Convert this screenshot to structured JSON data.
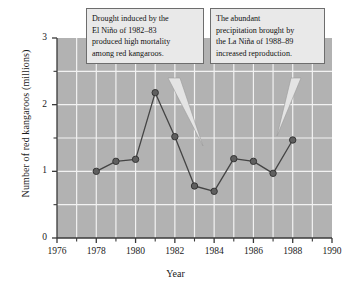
{
  "chart_data": {
    "type": "line",
    "title": "",
    "xlabel": "Year",
    "ylabel": "Number of red kangaroos (millions)",
    "xlim": [
      1976,
      1990
    ],
    "ylim": [
      0,
      3
    ],
    "x_major_ticks": [
      1976,
      1978,
      1980,
      1982,
      1984,
      1986,
      1988,
      1990
    ],
    "x_minor_ticks": [
      1977,
      1979,
      1981,
      1983,
      1985,
      1987,
      1989
    ],
    "y_major_ticks": [
      0,
      1,
      2,
      3
    ],
    "y_minor_ticks": [
      0.5,
      1.5,
      2.5
    ],
    "x_tick_labels": [
      "1976",
      "1978",
      "1980",
      "1982",
      "1984",
      "1986",
      "1988",
      "1990"
    ],
    "y_tick_labels": [
      "0",
      "1",
      "2",
      "3"
    ],
    "grid": true,
    "legend": null,
    "series": [
      {
        "name": "Red kangaroo population",
        "x": [
          1978,
          1979,
          1980,
          1981,
          1982,
          1983,
          1984,
          1985,
          1986,
          1987,
          1988
        ],
        "values": [
          1.0,
          1.15,
          1.18,
          2.18,
          1.52,
          0.78,
          0.7,
          1.19,
          1.15,
          0.97,
          1.47
        ]
      }
    ],
    "annotations": [
      {
        "id": "drought",
        "lines": [
          "Drought induced by the",
          "El Niño of 1982–83",
          "produced high mortality",
          "among red kangaroos."
        ],
        "points_to_year": 1983
      },
      {
        "id": "rain",
        "lines": [
          "The abundant",
          "precipitation brought by",
          "the La Niña of 1988–89",
          "increased reproduction."
        ],
        "points_to_year": 1988
      }
    ],
    "colors": {
      "plot_background": "#b2b2b2",
      "gridline": "#f2f2f2",
      "marker_fill": "#5f5f5f",
      "marker_stroke": "#353535",
      "line": "#444444",
      "axis": "#3a3a3a",
      "callout_background": "#e9e9e9",
      "callout_border": "#6d6d6d",
      "page_background": "#ffffff"
    }
  }
}
